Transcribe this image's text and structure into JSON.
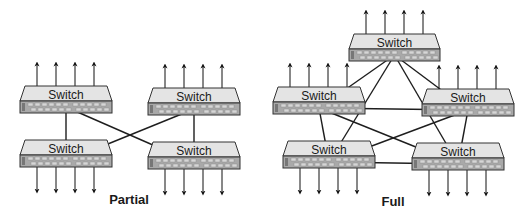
{
  "diagrams": [
    {
      "id": "partial",
      "caption": "Partial",
      "switches": [
        {
          "id": "p-tl",
          "label": "Switch",
          "uplinks": "up"
        },
        {
          "id": "p-tr",
          "label": "Switch",
          "uplinks": "up"
        },
        {
          "id": "p-bl",
          "label": "Switch",
          "uplinks": "down"
        },
        {
          "id": "p-br",
          "label": "Switch",
          "uplinks": "down"
        }
      ],
      "links": [
        [
          "p-tl",
          "p-bl"
        ],
        [
          "p-tr",
          "p-br"
        ],
        [
          "p-tl",
          "p-br"
        ],
        [
          "p-tr",
          "p-bl"
        ]
      ]
    },
    {
      "id": "full",
      "caption": "Full",
      "switches": [
        {
          "id": "f-top",
          "label": "Switch",
          "uplinks": "up"
        },
        {
          "id": "f-left",
          "label": "Switch",
          "uplinks": "up"
        },
        {
          "id": "f-right",
          "label": "Switch",
          "uplinks": "up"
        },
        {
          "id": "f-bl",
          "label": "Switch",
          "uplinks": "down"
        },
        {
          "id": "f-br",
          "label": "Switch",
          "uplinks": "down"
        }
      ],
      "links": [
        [
          "f-top",
          "f-left"
        ],
        [
          "f-top",
          "f-right"
        ],
        [
          "f-top",
          "f-bl"
        ],
        [
          "f-top",
          "f-br"
        ],
        [
          "f-left",
          "f-right"
        ],
        [
          "f-left",
          "f-bl"
        ],
        [
          "f-left",
          "f-br"
        ],
        [
          "f-right",
          "f-bl"
        ],
        [
          "f-right",
          "f-br"
        ],
        [
          "f-bl",
          "f-br"
        ]
      ]
    }
  ],
  "colors": {
    "switch_top": "#e4e4e4",
    "switch_panel": "#a9a9a9",
    "outline": "#333333",
    "link": "#1e1e1e"
  }
}
